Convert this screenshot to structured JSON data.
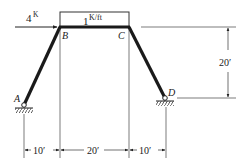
{
  "diagram": {
    "type": "frame-structure",
    "load_horizontal": {
      "magnitude": "4",
      "unit": "K",
      "at_node": "B",
      "direction": "right"
    },
    "load_distributed": {
      "magnitude": "1",
      "unit": "K/ft",
      "span": "B-C"
    },
    "nodes": {
      "A": {
        "label": "A",
        "support": "pin"
      },
      "B": {
        "label": "B"
      },
      "C": {
        "label": "C"
      },
      "D": {
        "label": "D",
        "support": "pin"
      }
    },
    "members": [
      "A-B",
      "B-C",
      "C-D"
    ],
    "dimensions": {
      "height": "20′",
      "span_left": "10′",
      "span_mid": "20′",
      "span_right": "10′"
    },
    "colors": {
      "member": "#1a1a1a",
      "line": "#333333",
      "background": "#ffffff"
    }
  }
}
